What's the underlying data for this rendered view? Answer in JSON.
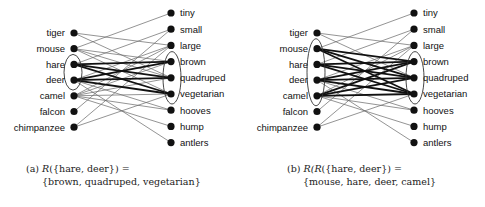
{
  "objects": [
    "tiger",
    "mouse",
    "hare",
    "deer",
    "camel",
    "falcon",
    "chimpanzee"
  ],
  "attributes": [
    "tiny",
    "small",
    "large",
    "brown",
    "quadruped",
    "vegetarian",
    "hooves",
    "hump",
    "antlers"
  ],
  "relation": [
    [
      "tiger",
      "large"
    ],
    [
      "tiger",
      "quadruped"
    ],
    [
      "mouse",
      "tiny"
    ],
    [
      "mouse",
      "brown"
    ],
    [
      "mouse",
      "quadruped"
    ],
    [
      "mouse",
      "vegetarian"
    ],
    [
      "hare",
      "small"
    ],
    [
      "hare",
      "brown"
    ],
    [
      "hare",
      "quadruped"
    ],
    [
      "hare",
      "vegetarian"
    ],
    [
      "deer",
      "large"
    ],
    [
      "deer",
      "brown"
    ],
    [
      "deer",
      "quadruped"
    ],
    [
      "deer",
      "vegetarian"
    ],
    [
      "deer",
      "hooves"
    ],
    [
      "deer",
      "antlers"
    ],
    [
      "camel",
      "large"
    ],
    [
      "camel",
      "brown"
    ],
    [
      "camel",
      "quadruped"
    ],
    [
      "camel",
      "vegetarian"
    ],
    [
      "camel",
      "hooves"
    ],
    [
      "camel",
      "hump"
    ],
    [
      "falcon",
      "small"
    ],
    [
      "chimpanzee",
      "large"
    ],
    [
      "chimpanzee",
      "vegetarian"
    ]
  ],
  "panels": [
    {
      "id": "a",
      "selected_objects": [
        "hare",
        "deer"
      ],
      "selected_attributes": [
        "brown",
        "quadruped",
        "vegetarian"
      ],
      "caption": {
        "tag": "(a)",
        "func": "R",
        "arg": "({hare, deer}) =",
        "result": "{brown, quadruped, vegetarian}"
      }
    },
    {
      "id": "b",
      "selected_objects": [
        "mouse",
        "hare",
        "deer",
        "camel"
      ],
      "selected_attributes": [
        "brown",
        "quadruped",
        "vegetarian"
      ],
      "caption": {
        "tag": "(b)",
        "func": "R(R",
        "arg": "({hare, deer}) =",
        "result": "{mouse, hare, deer, camel}"
      }
    }
  ],
  "colors": {
    "node": "#111111",
    "thin_edge": "#666666",
    "bold_edge": "#111111"
  }
}
